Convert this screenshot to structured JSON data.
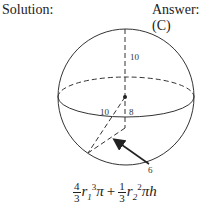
{
  "header": {
    "solution_label": "Solution:",
    "answer_label": "Answer: (C)"
  },
  "diagram": {
    "labels": {
      "top_radius": "10",
      "slant_radius": "10",
      "height": "8",
      "base_radius": "6"
    }
  },
  "formula": {
    "frac1_num": "4",
    "frac1_den": "3",
    "r1": "r",
    "r1_sub": "1",
    "r1_exp": "3",
    "pi1": "π",
    "plus": "+",
    "frac2_num": "1",
    "frac2_den": "3",
    "r2": "r",
    "r2_sub": "2",
    "r2_exp": "2",
    "pi2": "π",
    "h": "h"
  }
}
